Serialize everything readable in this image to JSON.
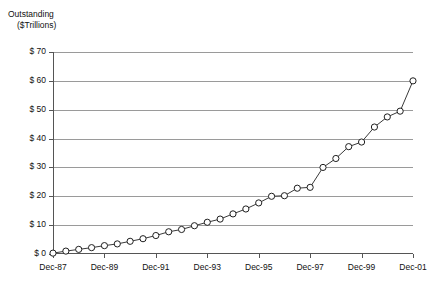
{
  "chart_data": {
    "type": "line",
    "title": "Outstanding ($Trillions)",
    "title_line1": "Outstanding",
    "title_line2": "($Trillions)",
    "xlabel": "",
    "ylabel": "Outstanding ($Trillions)",
    "ylim": [
      0,
      70
    ],
    "ytick_labels": [
      "$ 70",
      "$ 60",
      "$ 50",
      "$ 40",
      "$ 30",
      "$ 20",
      "$ 10",
      "$ 0"
    ],
    "ytick_values": [
      70,
      60,
      50,
      40,
      30,
      20,
      10,
      0
    ],
    "xtick_labels": [
      "Dec-87",
      "Dec-89",
      "Dec-91",
      "Dec-93",
      "Dec-95",
      "Dec-97",
      "Dec-99",
      "Dec-01"
    ],
    "xtick_values": [
      "Dec-87",
      "Dec-89",
      "Dec-91",
      "Dec-93",
      "Dec-95",
      "Dec-97",
      "Dec-99",
      "Dec-01"
    ],
    "grid": true,
    "legend": false,
    "legend_position": "none",
    "marker": "open-circle",
    "line_color": "#3a3a3a",
    "marker_fill": "#ffffff",
    "marker_stroke": "#1f1f1f",
    "grid_color": "#9a9a9a",
    "x": [
      "Dec-87",
      "Jun-88",
      "Dec-88",
      "Jun-89",
      "Dec-89",
      "Jun-90",
      "Dec-90",
      "Jun-91",
      "Dec-91",
      "Jun-92",
      "Dec-92",
      "Jun-93",
      "Dec-93",
      "Jun-94",
      "Dec-94",
      "Jun-95",
      "Dec-95",
      "Jun-96",
      "Dec-96",
      "Jun-97",
      "Dec-97",
      "Jun-98",
      "Dec-98",
      "Jun-99",
      "Dec-99",
      "Jun-00",
      "Dec-00",
      "Jun-01",
      "Dec-01"
    ],
    "values": [
      0.3,
      1.0,
      1.6,
      2.2,
      2.9,
      3.5,
      4.4,
      5.3,
      6.4,
      7.7,
      8.5,
      9.8,
      11.0,
      12.1,
      13.9,
      15.6,
      17.7,
      20.0,
      20.2,
      22.8,
      23.1,
      30.0,
      33.1,
      37.2,
      38.8,
      44.0,
      47.5,
      49.5,
      60.0
    ],
    "series": [
      {
        "name": "Outstanding",
        "values": [
          0.3,
          1.0,
          1.6,
          2.2,
          2.9,
          3.5,
          4.4,
          5.3,
          6.4,
          7.7,
          8.5,
          9.8,
          11.0,
          12.1,
          13.9,
          15.6,
          17.7,
          20.0,
          20.2,
          22.8,
          23.1,
          30.0,
          33.1,
          37.2,
          38.8,
          44.0,
          47.5,
          49.5,
          60.0
        ]
      }
    ]
  }
}
